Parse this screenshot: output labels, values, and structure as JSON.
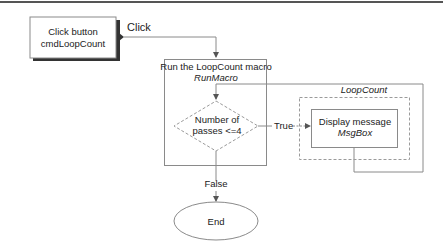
{
  "diagram": {
    "type": "flowchart",
    "colors": {
      "line": "#8a8a8a",
      "shadow": "#333333",
      "text": "#222222",
      "background": "#ffffff",
      "top_rule": "#555555"
    },
    "nodes": {
      "start": {
        "line1": "Click button",
        "line2": "cmdLoopCount"
      },
      "macro": {
        "title": "Run the LoopCount macro",
        "subtitle": "RunMacro"
      },
      "decision": {
        "line1": "Number of",
        "line2": "passes <=4"
      },
      "loop_group": {
        "label": "LoopCount"
      },
      "action": {
        "line1": "Display message",
        "line2": "MsgBox"
      },
      "end": {
        "label": "End"
      }
    },
    "edges": {
      "click": "Click",
      "true": "True",
      "false": "False"
    }
  }
}
